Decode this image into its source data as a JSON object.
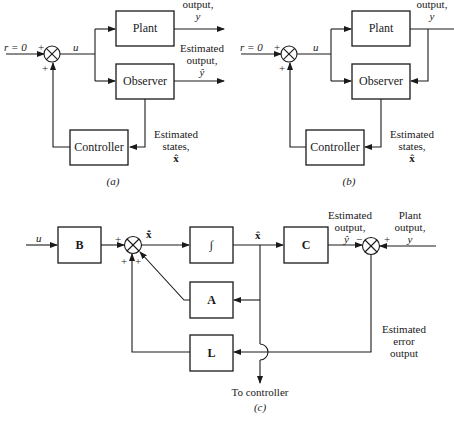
{
  "panel_a": {
    "caption": "(a)",
    "input_label": "r = 0",
    "plus_top": "+",
    "plus_bottom": "+",
    "signal_u": "u",
    "plant_label": "Plant",
    "observer_label": "Observer",
    "controller_label": "Controller",
    "plant_output_line1": "output,",
    "plant_output_line2": "y",
    "est_output_line1": "Estimated",
    "est_output_line2": "output,",
    "est_output_line3": "ŷ",
    "est_states_line1": "Estimated",
    "est_states_line2": "states,",
    "est_states_line3": "x̂"
  },
  "panel_b": {
    "caption": "(b)",
    "input_label": "r = 0",
    "plus_top": "+",
    "plus_bottom": "+",
    "signal_u": "u",
    "plant_label": "Plant",
    "observer_label": "Observer",
    "controller_label": "Controller",
    "plant_output_line1": "output,",
    "plant_output_line2": "y",
    "est_states_line1": "Estimated",
    "est_states_line2": "states,",
    "est_states_line3": "x̂"
  },
  "panel_c": {
    "caption": "(c)",
    "input_u": "u",
    "block_B": "B",
    "block_integrator": "∫",
    "block_C": "C",
    "block_A": "A",
    "block_L": "L",
    "xhat_dot": "x̂̇",
    "xhat": "x̂",
    "sum1_plus_left": "+",
    "sum1_plus_bottom_left": "+",
    "sum1_plus_bottom_right": "+",
    "sum2_minus": "−",
    "sum2_plus": "+",
    "est_output_line1": "Estimated",
    "est_output_line2": "output,",
    "est_output_line3": "ŷ",
    "plant_output_line1": "Plant",
    "plant_output_line2": "output,",
    "plant_output_line3": "y",
    "est_error_line1": "Estimated",
    "est_error_line2": "error",
    "est_error_line3": "output",
    "to_controller": "To controller"
  }
}
